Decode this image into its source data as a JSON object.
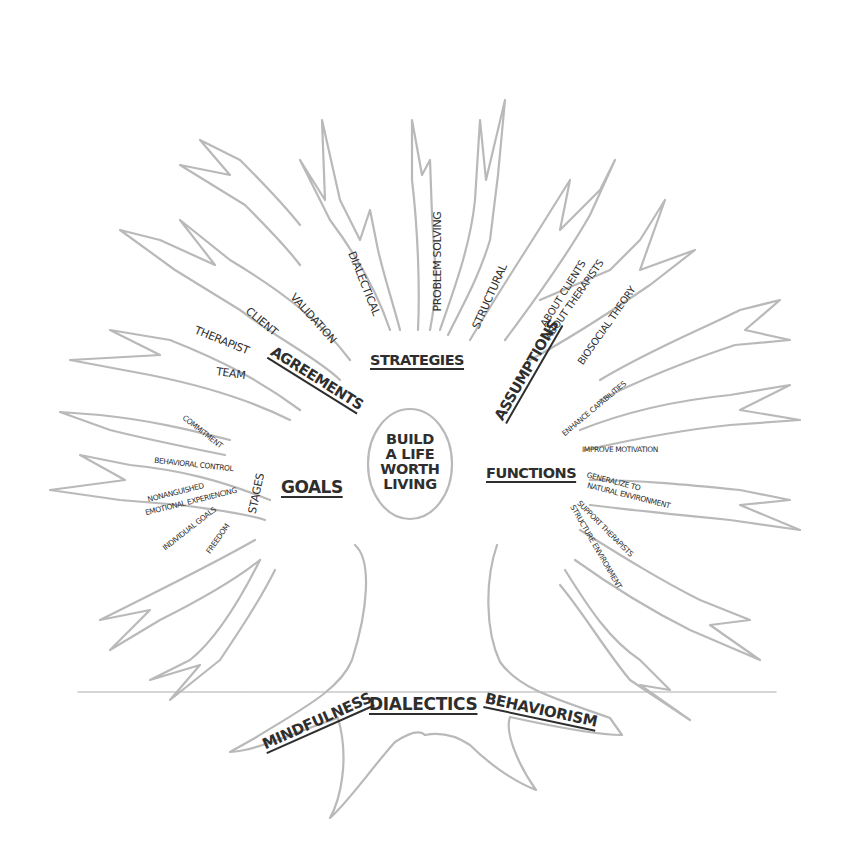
{
  "center": {
    "lines": [
      "BUILD",
      "A LIFE",
      "WORTH",
      "LIVING"
    ]
  },
  "branches": {
    "strategies": {
      "heading": "STRATEGIES",
      "items": [
        "VALIDATION",
        "DIALECTICAL",
        "PROBLEM SOLVING",
        "STRUCTURAL"
      ]
    },
    "agreements": {
      "heading": "AGREEMENTS",
      "items": [
        "CLIENT",
        "THERAPIST",
        "TEAM"
      ]
    },
    "assumptions": {
      "heading": "ASSUMPTIONS",
      "items": [
        "ABOUT CLIENTS",
        "ABOUT THERAPISTS",
        "BIOSOCIAL THEORY"
      ]
    },
    "goals": {
      "heading": "GOALS",
      "stages_label": "STAGES",
      "items": [
        "COMMITMENT",
        "BEHAVIORAL CONTROL",
        "NONANGUISHED",
        "EMOTIONAL EXPERIENCING",
        "INDIVIDUAL GOALS",
        "FREEDOM"
      ]
    },
    "functions": {
      "heading": "FUNCTIONS",
      "items": [
        "ENHANCE CAPABILITIES",
        "IMPROVE MOTIVATION",
        "GENERALIZE TO",
        "NATURAL ENVIRONMENT",
        "SUPPORT THERAPISTS",
        "STRUCTURE ENVIRONMENT"
      ]
    }
  },
  "roots": [
    "MINDFULNESS",
    "DIALECTICS",
    "BEHAVIORISM"
  ],
  "colors": {
    "outline": "#b9b9b9",
    "text": "#2e2e2e",
    "background": "#ffffff"
  }
}
